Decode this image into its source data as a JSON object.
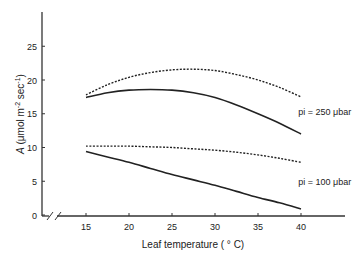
{
  "chart_data": {
    "type": "line",
    "title": "",
    "xlabel": "Leaf temperature ( ° C)",
    "ylabel": "A (µmol m⁻² sec⁻¹)",
    "ylabel_parts": {
      "italic": "A",
      "rest": " (μmol m",
      "sup1": "-2",
      "mid": " sec",
      "sup2": "-1",
      "end": ")"
    },
    "xlim": [
      15,
      40
    ],
    "ylim": [
      0,
      30
    ],
    "x_ticks": [
      15,
      20,
      25,
      30,
      35,
      40
    ],
    "y_ticks": [
      0,
      5,
      10,
      15,
      20,
      25
    ],
    "axis_break": true,
    "grid": false,
    "legend": "inline labels at right",
    "x": [
      15,
      17.5,
      20,
      22.5,
      25,
      27.5,
      30,
      32.5,
      35,
      37.5,
      40
    ],
    "series": [
      {
        "name": "pi = 250 µbar (dashed)",
        "style": "dashed",
        "group": "pi = 250 µbar",
        "values": [
          17.8,
          19.3,
          20.4,
          21.1,
          21.5,
          21.6,
          21.4,
          20.8,
          20.0,
          18.9,
          17.5
        ]
      },
      {
        "name": "pi = 250 µbar (solid)",
        "style": "solid",
        "group": "pi = 250 µbar",
        "values": [
          17.4,
          18.1,
          18.5,
          18.6,
          18.5,
          18.1,
          17.4,
          16.3,
          15.0,
          13.6,
          12.0
        ]
      },
      {
        "name": "pi = 100 µbar (dashed)",
        "style": "dashed",
        "group": "pi = 100 µbar",
        "values": [
          10.2,
          10.2,
          10.2,
          10.1,
          10.0,
          9.8,
          9.6,
          9.3,
          8.9,
          8.4,
          7.8
        ]
      },
      {
        "name": "pi = 100 µbar (solid)",
        "style": "solid",
        "group": "pi = 100 µbar",
        "values": [
          9.4,
          8.6,
          7.8,
          6.9,
          6.0,
          5.2,
          4.4,
          3.5,
          2.6,
          1.8,
          0.9
        ]
      }
    ],
    "annotations": [
      {
        "text": "pi = 250 μbar",
        "x": 40.5,
        "y": 14.8
      },
      {
        "text": "pi = 100 μbar",
        "x": 40.5,
        "y": 4.5
      }
    ]
  }
}
